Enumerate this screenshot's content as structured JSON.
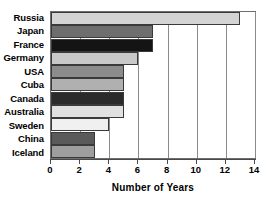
{
  "chart_data": {
    "type": "bar",
    "orientation": "horizontal",
    "title": "",
    "xlabel": "Number of Years",
    "ylabel": "",
    "xlim": [
      0,
      14
    ],
    "xticks": [
      0,
      2,
      4,
      6,
      8,
      10,
      12,
      14
    ],
    "xtick_labels": [
      "0",
      "2",
      "4",
      "6",
      "8",
      "10",
      "12",
      "14"
    ],
    "grid": true,
    "grid_axis": "x",
    "legend": "none",
    "categories": [
      "Russia",
      "Japan",
      "France",
      "Germany",
      "USA",
      "Cuba",
      "Canada",
      "Australia",
      "Sweden",
      "China",
      "Iceland"
    ],
    "values": [
      13,
      7,
      7,
      6,
      5,
      5,
      5,
      5,
      4,
      3,
      3
    ],
    "bars": [
      {
        "category": "Russia",
        "value": 13,
        "color": "#d4d4d4"
      },
      {
        "category": "Japan",
        "value": 7,
        "color": "#6e6e6e"
      },
      {
        "category": "France",
        "value": 7,
        "color": "#141414"
      },
      {
        "category": "Germany",
        "value": 6,
        "color": "#c9c9c9"
      },
      {
        "category": "USA",
        "value": 5,
        "color": "#8c8c8c"
      },
      {
        "category": "Cuba",
        "value": 5,
        "color": "#b0b0b0"
      },
      {
        "category": "Canada",
        "value": 5,
        "color": "#2b2b2b"
      },
      {
        "category": "Australia",
        "value": 5,
        "color": "#e0e0e0"
      },
      {
        "category": "Sweden",
        "value": 4,
        "color": "#f0f0f0"
      },
      {
        "category": "China",
        "value": 3,
        "color": "#5a5a5a"
      },
      {
        "category": "Iceland",
        "value": 3,
        "color": "#9e9e9e"
      }
    ],
    "colors": {
      "bar_edge": "#3a3a3a",
      "gridline": "#8a8a8a",
      "axis": "#4a4a4a",
      "text": "#000000",
      "background": "#ffffff"
    }
  }
}
